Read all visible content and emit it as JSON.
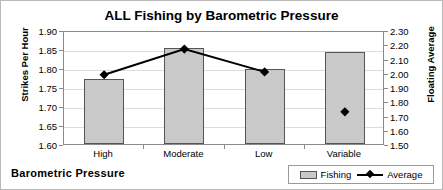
{
  "chart_data": {
    "type": "bar",
    "title": "ALL Fishing by Barometric Pressure",
    "xlabel": "Barometric Pressure",
    "categories": [
      "High",
      "Moderate",
      "Low",
      "Variable"
    ],
    "grid": true,
    "legend_position": "bottom-right",
    "axes": {
      "left": {
        "label": "Strikes Per Hour",
        "ylim": [
          1.6,
          1.9
        ],
        "ticks": [
          "1.90",
          "1.85",
          "1.80",
          "1.75",
          "1.70",
          "1.65",
          "1.60"
        ],
        "tick_values": [
          1.9,
          1.85,
          1.8,
          1.75,
          1.7,
          1.65,
          1.6
        ],
        "step": 0.05
      },
      "right": {
        "label": "Floating Average",
        "ylim": [
          1.5,
          2.3
        ],
        "ticks": [
          "2.30",
          "2.20",
          "2.10",
          "2.00",
          "1.90",
          "1.80",
          "1.70",
          "1.60",
          "1.50"
        ],
        "tick_values": [
          2.3,
          2.2,
          2.1,
          2.0,
          1.9,
          1.8,
          1.7,
          1.6,
          1.5
        ],
        "step": 0.1
      }
    },
    "series": [
      {
        "name": "Fishing",
        "type": "bar",
        "axis": "left",
        "color": "#c9c9c9",
        "border_color": "#555555",
        "values": [
          1.77,
          1.853,
          1.797,
          1.843
        ]
      },
      {
        "name": "Average",
        "type": "line",
        "axis": "right",
        "color": "#000000",
        "marker": "diamond",
        "values": [
          2.0,
          2.18,
          2.02,
          1.74
        ],
        "connected_points": [
          "High",
          "Moderate",
          "Low"
        ]
      }
    ]
  },
  "legend": {
    "items": [
      {
        "label": "Fishing"
      },
      {
        "label": "Average"
      }
    ]
  },
  "colors": {
    "bar_fill": "#c9c9c9",
    "bar_border": "#555555",
    "line": "#000000",
    "grid": "#dcdcdc",
    "axis": "#8a8a8a",
    "frame": "#b9b9b9"
  }
}
